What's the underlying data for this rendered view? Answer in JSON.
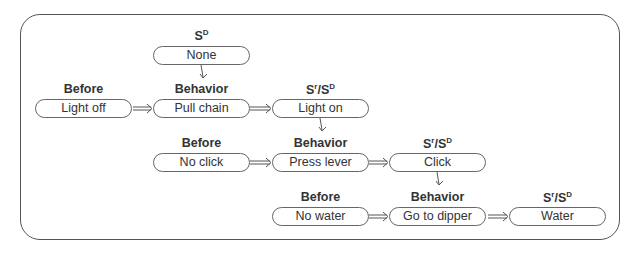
{
  "diagram": {
    "rows": [
      {
        "before": {
          "label": "Before",
          "box": "Light off"
        },
        "sd": {
          "label_main": "S",
          "label_sup": "D",
          "box": "None"
        },
        "behavior": {
          "label": "Behavior",
          "box": "Pull chain"
        },
        "consequence": {
          "label_s": "S",
          "label_r": "r",
          "label_slash": "/S",
          "label_d": "D",
          "box": "Light on"
        }
      },
      {
        "before": {
          "label": "Before",
          "box": "No click"
        },
        "behavior": {
          "label": "Behavior",
          "box": "Press lever"
        },
        "consequence": {
          "label_s": "S",
          "label_r": "r",
          "label_slash": "/S",
          "label_d": "D",
          "box": "Click"
        }
      },
      {
        "before": {
          "label": "Before",
          "box": "No water"
        },
        "behavior": {
          "label": "Behavior",
          "box": "Go to dipper"
        },
        "consequence": {
          "label_s": "S",
          "label_r": "r",
          "label_slash": "/S",
          "label_d": "D",
          "box": "Water"
        }
      }
    ]
  }
}
